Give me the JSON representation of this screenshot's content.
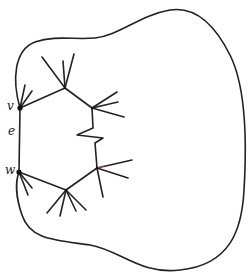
{
  "diagram": {
    "labels": {
      "v": "v",
      "e": "e",
      "w": "w"
    },
    "colors": {
      "stroke": "#222222",
      "background": "#ffffff",
      "accent": "#cc3355"
    },
    "vertices": {
      "v": [
        20,
        108
      ],
      "w": [
        19,
        172
      ],
      "upper_hub_1": [
        65,
        88
      ],
      "upper_hub_2": [
        92,
        108
      ],
      "lower_hub_1": [
        66,
        190
      ],
      "lower_hub_2": [
        97,
        168
      ]
    }
  }
}
